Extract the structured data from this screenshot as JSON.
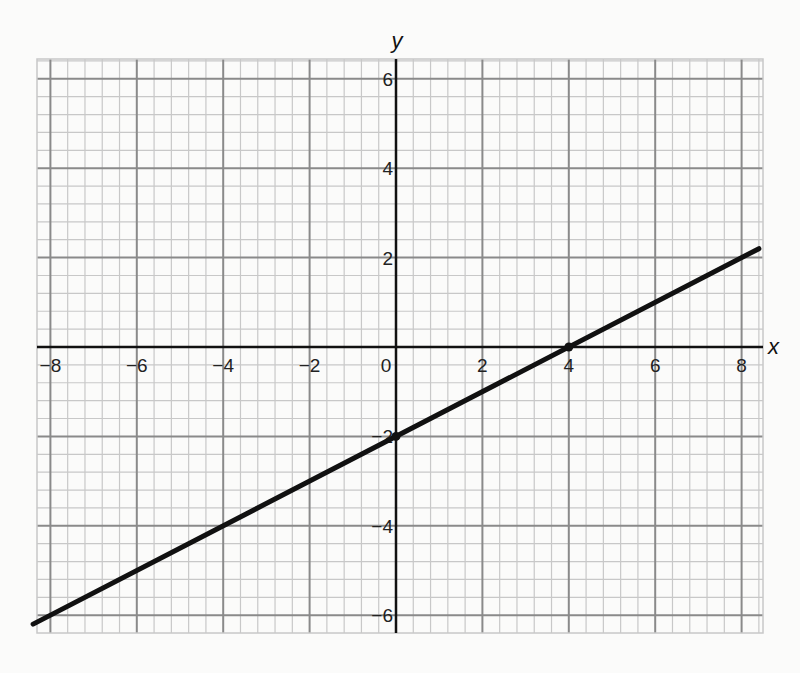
{
  "chart_data": {
    "type": "line",
    "title": "",
    "xlabel": "x",
    "ylabel": "y",
    "xlim": [
      -8.4,
      8.4
    ],
    "ylim": [
      -6.3,
      6.4
    ],
    "grid": true,
    "grid_major_step": 2,
    "grid_minor_step": 0.4,
    "x_ticks": [
      -8,
      -6,
      -4,
      -2,
      0,
      2,
      4,
      6,
      8
    ],
    "x_tick_labels": [
      "−8",
      "−6",
      "−4",
      "−2",
      "0",
      "2",
      "4",
      "6",
      "8"
    ],
    "y_ticks": [
      6,
      4,
      2,
      -2,
      -4,
      -6
    ],
    "y_tick_labels": [
      "6",
      "4",
      "2",
      "−2",
      "−4",
      "−6"
    ],
    "series": [
      {
        "name": "line",
        "equation": "y = 0.5x - 2",
        "slope": 0.5,
        "intercept": -2,
        "x": [
          -8.4,
          8.4
        ],
        "y": [
          -6.2,
          2.2
        ],
        "color": "#111111"
      }
    ],
    "marked_points": [
      {
        "x": 0,
        "y": -2
      },
      {
        "x": 4,
        "y": 0
      }
    ],
    "legend": null
  },
  "colors": {
    "background": "#fbfbfa",
    "minor_grid": "#c8c8c8",
    "major_grid": "#8a8a8a",
    "axis": "#111111",
    "line": "#111111"
  }
}
